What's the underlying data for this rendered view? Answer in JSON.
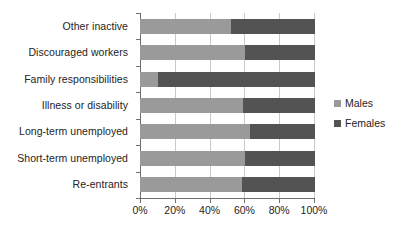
{
  "chart_data": {
    "type": "bar",
    "orientation": "horizontal",
    "stacked": true,
    "normalized": true,
    "title": "",
    "subtitle": "",
    "xlabel": "",
    "ylabel": "",
    "xlim": [
      0,
      100
    ],
    "xticks": [
      0,
      20,
      40,
      60,
      80,
      100
    ],
    "xtick_labels": [
      "0%",
      "20%",
      "40%",
      "60%",
      "80%",
      "100%"
    ],
    "grid": "vertical",
    "legend_position": "right",
    "categories": [
      "Other inactive",
      "Discouraged workers",
      "Family responsibilities",
      "Illness or disability",
      "Long-term unemployed",
      "Short-term unemployed",
      "Re-entrants"
    ],
    "series": [
      {
        "name": "Males",
        "color": "#9a9a9a",
        "values": [
          52,
          60,
          10,
          59,
          63,
          60,
          58
        ]
      },
      {
        "name": "Females",
        "color": "#535353",
        "values": [
          48,
          40,
          90,
          41,
          37,
          40,
          42
        ]
      }
    ]
  },
  "legend": {
    "items": [
      {
        "label": "Males",
        "color": "#9a9a9a"
      },
      {
        "label": "Females",
        "color": "#535353"
      }
    ]
  },
  "axis": {
    "x_tick_labels": [
      "0%",
      "20%",
      "40%",
      "60%",
      "80%",
      "100%"
    ],
    "y_tick_labels": [
      "Other inactive",
      "Discouraged workers",
      "Family responsibilities",
      "Illness or disability",
      "Long-term unemployed",
      "Short-term unemployed",
      "Re-entrants"
    ]
  },
  "colors": {
    "males": "#9a9a9a",
    "females": "#535353",
    "axis": "#6e6e6e",
    "grid": "#c9c9c9",
    "background": "#ffffff",
    "text": "#242424"
  }
}
